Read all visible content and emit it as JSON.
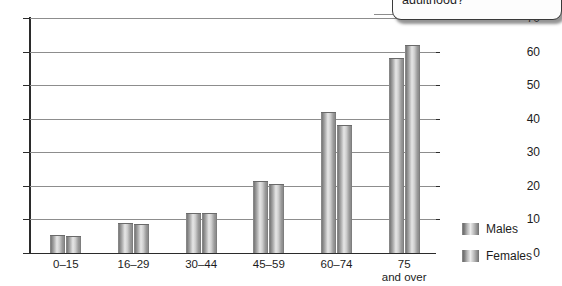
{
  "callout": {
    "text": "adulthood?",
    "partial_line_above": ""
  },
  "legend": {
    "items": [
      {
        "label": "Males",
        "swatch": "gradient-gray-cylinder"
      },
      {
        "label": "Females",
        "swatch": "gradient-gray-cylinder"
      }
    ]
  },
  "axis": {
    "y_ticks": [
      "70",
      "60",
      "50",
      "40",
      "30",
      "20",
      "10",
      "0"
    ],
    "x_labels": [
      {
        "main": "0–15",
        "sub": ""
      },
      {
        "main": "16–29",
        "sub": ""
      },
      {
        "main": "30–44",
        "sub": ""
      },
      {
        "main": "45–59",
        "sub": ""
      },
      {
        "main": "60–74",
        "sub": ""
      },
      {
        "main": "75",
        "sub": "and over"
      }
    ]
  },
  "chart_data": {
    "type": "bar",
    "title": "",
    "xlabel": "",
    "ylabel": "",
    "ylim": [
      0,
      70
    ],
    "ytick_step": 10,
    "grid": true,
    "legend_position": "right",
    "categories": [
      "0–15",
      "16–29",
      "30–44",
      "45–59",
      "60–74",
      "75 and over"
    ],
    "series": [
      {
        "name": "Males",
        "values": [
          5.5,
          9,
          12,
          21.5,
          42,
          58
        ]
      },
      {
        "name": "Females",
        "values": [
          5,
          8.5,
          12,
          20.5,
          38,
          62
        ]
      }
    ],
    "colors": {
      "bar_fill_dark": "#6f6f6f",
      "bar_fill_light": "#e6e6e6",
      "axis": "#2b2b2b",
      "gridline": "#8d8d8d",
      "background": "#ffffff"
    }
  }
}
